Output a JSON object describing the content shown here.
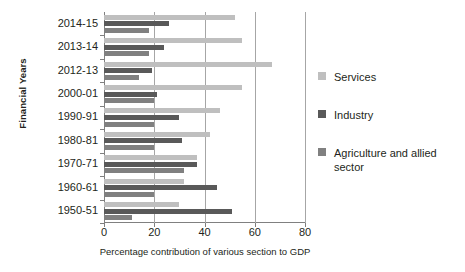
{
  "chart_data": {
    "type": "bar",
    "orientation": "horizontal",
    "title": "",
    "xlabel": "Percentage contribution of various section to GDP",
    "ylabel": "Financial Years",
    "xlim": [
      0,
      80
    ],
    "xticks": [
      0,
      20,
      40,
      60,
      80
    ],
    "grid": true,
    "legend_position": "right",
    "categories": [
      "2014-15",
      "2013-14",
      "2012-13",
      "2000-01",
      "1990-91",
      "1980-81",
      "1970-71",
      "1960-61",
      "1950-51"
    ],
    "series": [
      {
        "name": "Services",
        "color": "#bfbfbf",
        "values": [
          52,
          55,
          67,
          55,
          46,
          42,
          37,
          32,
          30
        ]
      },
      {
        "name": "Industry",
        "color": "#595959",
        "values": [
          26,
          24,
          19,
          21,
          30,
          31,
          37,
          45,
          51
        ]
      },
      {
        "name": "Agriculture and allied sector",
        "color": "#808080",
        "values": [
          18,
          18,
          14,
          20,
          20,
          20,
          32,
          20,
          11
        ]
      }
    ]
  },
  "legend": {
    "items": [
      {
        "label": "Services"
      },
      {
        "label": "Industry"
      },
      {
        "label": "Agriculture and allied sector"
      }
    ]
  }
}
